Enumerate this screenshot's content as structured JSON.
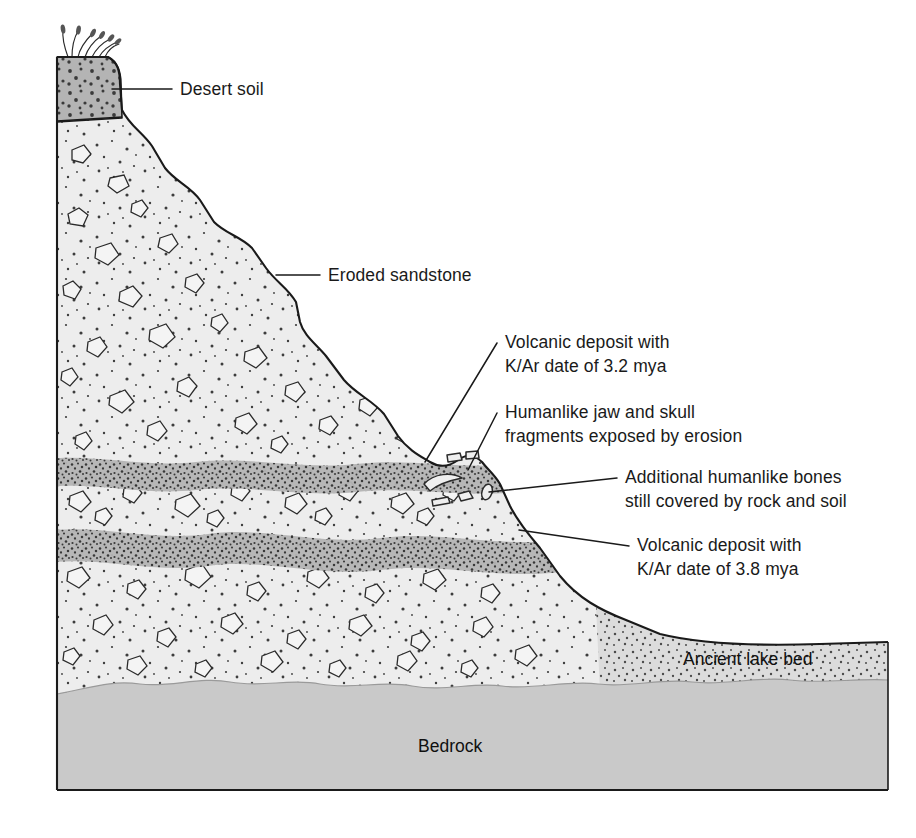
{
  "figure": {
    "background_color": "#ffffff"
  },
  "palette": {
    "desert_soil": "#b4b4b4",
    "sandstone": "#ededed",
    "volcanic_ash": "#b0b0b0",
    "ancient_lake_bed": "#d8d8d8",
    "bedrock": "#c9c9c9",
    "outline": "#1a1a1a",
    "text": "#1a1a1a",
    "stipple": "#4a4a4a"
  },
  "labels": [
    {
      "id": "desert-soil",
      "name": "desert-soil-label",
      "lines": [
        "Desert soil"
      ],
      "text_x": 180,
      "text_y": 95,
      "anchor": "start",
      "leader": "M 112 89 L 172 89",
      "placement": "callout"
    },
    {
      "id": "eroded-sandstone",
      "name": "eroded-sandstone-label",
      "lines": [
        "Eroded sandstone"
      ],
      "text_x": 328,
      "text_y": 281,
      "anchor": "start",
      "leader": "M 276 275 L 320 275",
      "placement": "callout"
    },
    {
      "id": "volcanic-32",
      "name": "volcanic-deposit-3-2-mya-label",
      "lines": [
        "Volcanic deposit with",
        "K/Ar date of 3.2 mya"
      ],
      "text_x": 505,
      "text_y": 348,
      "anchor": "start",
      "leader": "M 425 462 L 497 343",
      "placement": "callout"
    },
    {
      "id": "jaw-skull",
      "name": "humanlike-jaw-skull-label",
      "lines": [
        "Humanlike jaw and skull",
        "fragments exposed by erosion"
      ],
      "text_x": 505,
      "text_y": 418,
      "anchor": "start",
      "leader": "M 468 470 L 497 413",
      "placement": "callout"
    },
    {
      "id": "additional-bones",
      "name": "additional-humanlike-bones-label",
      "lines": [
        "Additional humanlike bones",
        "still covered by rock and soil"
      ],
      "text_x": 625,
      "text_y": 483,
      "anchor": "start",
      "leader": "M 489 492 L 617 478",
      "placement": "callout"
    },
    {
      "id": "volcanic-38",
      "name": "volcanic-deposit-3-8-mya-label",
      "lines": [
        "Volcanic deposit with",
        "K/Ar date of 3.8 mya"
      ],
      "text_x": 637,
      "text_y": 551,
      "anchor": "start",
      "leader": "M 519 530 L 629 546",
      "placement": "callout"
    },
    {
      "id": "ancient-lake-bed",
      "name": "ancient-lake-bed-label",
      "lines": [
        "Ancient lake bed"
      ],
      "text_x": 683,
      "text_y": 665,
      "anchor": "start",
      "leader": "",
      "placement": "inline"
    },
    {
      "id": "bedrock",
      "name": "bedrock-label",
      "lines": [
        "Bedrock"
      ],
      "text_x": 418,
      "text_y": 752,
      "anchor": "start",
      "leader": "",
      "placement": "inline"
    }
  ],
  "strata": [
    {
      "id": "desert-soil",
      "name": "desert-soil-layer",
      "display_name": "Desert soil",
      "fill": "#b4b4b4",
      "texture": "coarse-dots",
      "order": 1
    },
    {
      "id": "upper-sandstone",
      "name": "upper-sandstone-layer",
      "display_name": "Eroded sandstone",
      "fill": "#ededed",
      "texture": "pebbles-and-stipple",
      "order": 2
    },
    {
      "id": "volcanic-upper",
      "name": "volcanic-ash-layer-3-2-mya",
      "display_name": "Volcanic deposit with K/Ar date of 3.2 mya",
      "fill": "#b0b0b0",
      "texture": "dense-stipple",
      "order": 3,
      "age_mya": 3.2,
      "dating_method": "K/Ar"
    },
    {
      "id": "middle-sandstone",
      "name": "middle-sandstone-layer",
      "display_name": "Eroded sandstone",
      "fill": "#ededed",
      "texture": "pebbles-and-stipple",
      "order": 4
    },
    {
      "id": "volcanic-lower",
      "name": "volcanic-ash-layer-3-8-mya",
      "display_name": "Volcanic deposit with K/Ar date of 3.8 mya",
      "fill": "#b0b0b0",
      "texture": "dense-stipple",
      "order": 5,
      "age_mya": 3.8,
      "dating_method": "K/Ar"
    },
    {
      "id": "lower-sandstone",
      "name": "lower-sandstone-layer",
      "display_name": "Eroded sandstone",
      "fill": "#ededed",
      "texture": "pebbles-and-stipple",
      "order": 6
    },
    {
      "id": "ancient-lake-bed",
      "name": "ancient-lake-bed-layer",
      "display_name": "Ancient lake bed",
      "fill": "#d8d8d8",
      "texture": "fine-stipple",
      "order": 7
    },
    {
      "id": "bedrock",
      "name": "bedrock-layer",
      "display_name": "Bedrock",
      "fill": "#c9c9c9",
      "texture": "solid",
      "order": 8
    }
  ],
  "features": {
    "grass_tufts": 7,
    "exposed_bone_fragments": 3,
    "buried_bone_fragments": 4
  }
}
